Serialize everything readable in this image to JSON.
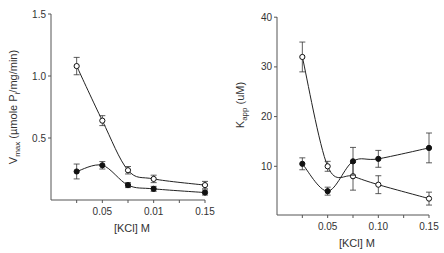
{
  "chart_data": [
    {
      "type": "line",
      "title": "",
      "xlabel": "[KCl]  M",
      "ylabel": "Vmax (µmole Pi/mg/min)",
      "x_tick_labels": [
        "0.05",
        "0.01",
        "0.15"
      ],
      "x_tick_positions": [
        0.05,
        0.1,
        0.15
      ],
      "y_tick_labels": [
        "0.5",
        "1.0",
        "1.5"
      ],
      "ylim": [
        0,
        1.5
      ],
      "xlim": [
        0,
        0.15
      ],
      "grid": false,
      "legend": "none",
      "x": [
        0.025,
        0.05,
        0.075,
        0.1,
        0.15
      ],
      "series": [
        {
          "name": "open circles",
          "marker": "open-circle",
          "values": [
            1.08,
            0.64,
            0.24,
            0.17,
            0.12
          ],
          "errors": [
            0.07,
            0.04,
            0.03,
            0.03,
            0.03
          ]
        },
        {
          "name": "filled circles",
          "marker": "filled-circle",
          "values": [
            0.23,
            0.28,
            0.12,
            0.09,
            0.06
          ],
          "errors": [
            0.06,
            0.03,
            0.02,
            0.02,
            0.02
          ]
        }
      ]
    },
    {
      "type": "line",
      "title": "",
      "xlabel": "[KCl]  M",
      "ylabel": "Kapp (uM)",
      "x_tick_labels": [
        "0.05",
        "0.10",
        "0.15"
      ],
      "x_tick_positions": [
        0.05,
        0.1,
        0.15
      ],
      "y_tick_labels": [
        "10",
        "20",
        "30",
        "40"
      ],
      "ylim": [
        0,
        40
      ],
      "xlim": [
        0,
        0.15
      ],
      "grid": false,
      "legend": "none",
      "x": [
        0.025,
        0.05,
        0.075,
        0.1,
        0.15
      ],
      "series": [
        {
          "name": "open circles",
          "marker": "open-circle",
          "values": [
            32,
            10,
            8,
            6.3,
            3.5
          ],
          "errors": [
            3,
            1,
            2.8,
            1.8,
            1.3
          ]
        },
        {
          "name": "filled circles",
          "marker": "filled-circle",
          "values": [
            10.5,
            5,
            11,
            11.5,
            13.7
          ],
          "errors": [
            1.2,
            0.8,
            2.8,
            1.7,
            3
          ]
        }
      ]
    }
  ]
}
